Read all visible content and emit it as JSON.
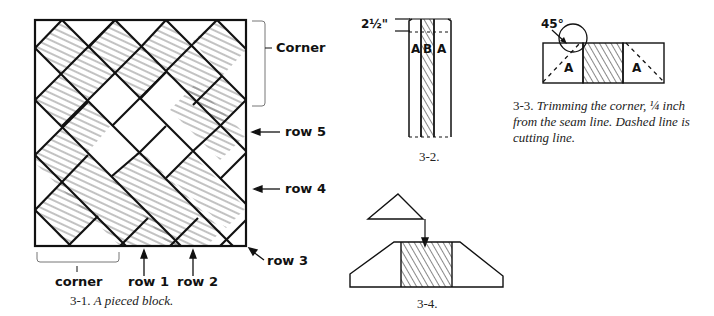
{
  "figure_3_1": {
    "caption_number": "3-1.",
    "caption_text": "A pieced block.",
    "labels": {
      "corner_top": "Corner",
      "row5": "row 5",
      "row4": "row 4",
      "row3": "row 3",
      "corner_bottom": "corner",
      "row1": "row 1",
      "row2": "row 2"
    }
  },
  "figure_3_2": {
    "caption": "3-2.",
    "dimension": "2½\"",
    "strip_labels": [
      "A",
      "B",
      "A"
    ]
  },
  "figure_3_3": {
    "angle_label": "45°",
    "square_labels": [
      "A",
      "A"
    ],
    "caption_number": "3-3.",
    "caption_lines": [
      "Trimming the corner, ¼ inch",
      "from the seam line. Dashed line is",
      "cutting line."
    ]
  },
  "figure_3_4": {
    "caption": "3-4."
  },
  "colors": {
    "ink": "#111111",
    "hatch": "#555555",
    "background": "#ffffff"
  }
}
